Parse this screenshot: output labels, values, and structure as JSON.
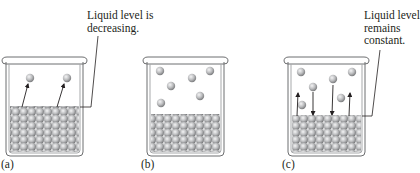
{
  "figure": {
    "panels": [
      {
        "id": "a",
        "panel_label": "(a)",
        "annotation": "Liquid level is\ndecreasing.",
        "description": "Evaporation only: molecules leave liquid surface into closed container",
        "gas_molecules": 2,
        "arrows": [
          {
            "direction": "up"
          },
          {
            "direction": "up"
          }
        ]
      },
      {
        "id": "b",
        "panel_label": "(b)",
        "annotation": "",
        "description": "Vapor molecules accumulate above liquid",
        "gas_molecules": 6,
        "arrows": []
      },
      {
        "id": "c",
        "panel_label": "(c)",
        "annotation": "Liquid level\nremains\nconstant.",
        "description": "Dynamic equilibrium: evaporation equals condensation",
        "gas_molecules": 6,
        "arrows": [
          {
            "direction": "up"
          },
          {
            "direction": "down"
          },
          {
            "direction": "down"
          },
          {
            "direction": "up"
          }
        ]
      }
    ],
    "colors": {
      "beaker_stroke": "#6d6e70",
      "beaker_fill": "#ffffff",
      "beaker_wall": "#d8d9da",
      "molecule_light": "#e6e7e8",
      "molecule_dark": "#8a8b8d",
      "text": "#231f20",
      "arrow": "#231f20"
    }
  }
}
